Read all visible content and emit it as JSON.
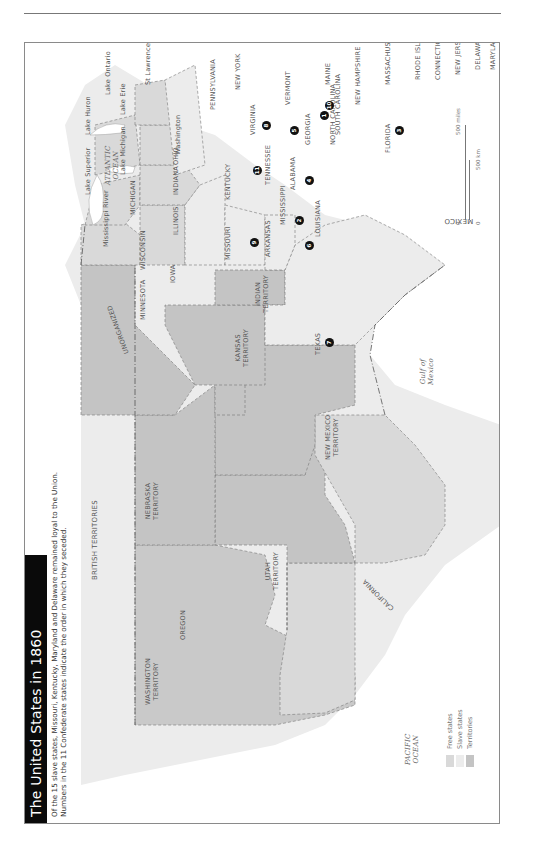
{
  "page": {
    "running_head": "EUROPE"
  },
  "map": {
    "title": "The United States in 1860",
    "subtitle_line1": "Of the 15 slave states, Missouri, Kentucky, Maryland and Delaware remained loyal to the Union.",
    "subtitle_line2": "Numbers in the 11 Confederate states indicate the order in which they seceded.",
    "colors": {
      "free_state": "#d9d9d9",
      "slave_state": "#ececec",
      "territory": "#c4c4c4",
      "foreign_land": "#eeeeee",
      "water": "#ffffff",
      "title_bar": "#0a0a0a",
      "border": "#666666"
    },
    "regions": {
      "british_territories": "BRITISH TERRITORIES",
      "mexico": "MEXICO",
      "pacific": "PACIFIC\nOCEAN",
      "atlantic": "ATLANTIC\nOCEAN",
      "gulf": "Gulf of\nMexico"
    },
    "territories": {
      "washington": "WASHINGTON\nTERRITORY",
      "nebraska": "NEBRASKA\nTERRITORY",
      "unorganized": "UNORGANIZED",
      "utah": "UTAH\nTERRITORY",
      "new_mexico": "NEW MEXICO\nTERRITORY",
      "kansas": "KANSAS\nTERRITORY",
      "indian": "INDIAN\nTERRITORY"
    },
    "states": {
      "oregon": "OREGON",
      "california": "CALIFORNIA",
      "minnesota": "MINNESOTA",
      "iowa": "IOWA",
      "wisconsin": "WISCONSIN",
      "illinois": "ILLINOIS",
      "michigan": "MICHIGAN",
      "indiana": "INDIANA",
      "ohio": "OHIO",
      "missouri": "MISSOURI",
      "kentucky": "KENTUCKY",
      "arkansas": "ARKANSAS",
      "texas": "TEXAS",
      "louisiana": "LOUISIANA",
      "mississippi": "MISSISSIPPI",
      "alabama": "ALABAMA",
      "tennessee": "TENNESSEE",
      "georgia": "GEORGIA",
      "florida": "FLORIDA",
      "south_carolina": "SOUTH CAROLINA",
      "north_carolina": "NORTH CAROLINA",
      "virginia": "VIRGINIA",
      "pennsylvania": "PENNSYLVANIA",
      "new_york": "NEW YORK",
      "vermont": "VERMONT",
      "maine": "MAINE",
      "new_hampshire": "NEW\nHAMPSHIRE",
      "massachusetts": "MASSACHUSETTS",
      "rhode_island": "RHODE ISLAND",
      "connecticut": "CONNECTICUT",
      "new_jersey": "NEW JERSEY",
      "delaware": "DELAWARE",
      "maryland": "MARYLAND"
    },
    "water_features": {
      "lake_superior": "Lake Superior",
      "lake_michigan": "Lake Michigan",
      "lake_huron": "Lake Huron",
      "lake_erie": "Lake Erie",
      "lake_ontario": "Lake Ontario",
      "mississippi_river": "Mississippi River",
      "st_lawrence_river": "St Lawrence River"
    },
    "cities": {
      "washington": "Washington"
    },
    "secession_order": {
      "south_carolina": "1",
      "mississippi": "2",
      "florida": "3",
      "alabama": "4",
      "georgia": "5",
      "louisiana": "6",
      "texas": "7",
      "virginia": "8",
      "arkansas": "9",
      "north_carolina": "10",
      "tennessee": "11"
    },
    "legend": {
      "free": "Free states",
      "slave": "Slave states",
      "territories": "Territories"
    },
    "scale": {
      "zero_top": "0",
      "miles": "500 miles",
      "zero_bottom": "0",
      "km": "500 km"
    }
  }
}
